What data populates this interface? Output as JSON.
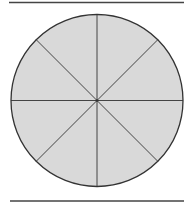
{
  "figure": {
    "sector_count": 8,
    "colors": {
      "fill": "#d9d9d9",
      "stroke": "#333333",
      "rule": "#444444",
      "background": "#ffffff"
    }
  }
}
